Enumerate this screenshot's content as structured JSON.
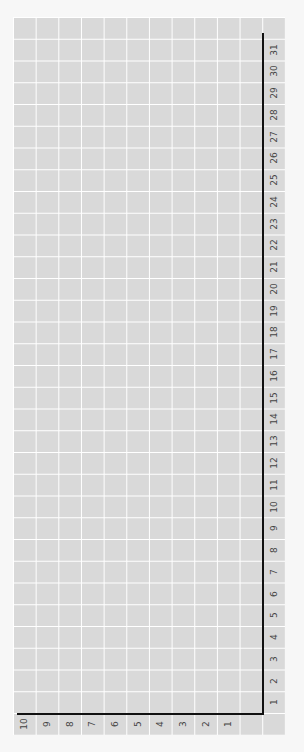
{
  "chart_data": {
    "type": "table",
    "title": "",
    "orientation": "rotated -90deg",
    "x_ticks": [
      "1",
      "2",
      "3",
      "4",
      "5",
      "6",
      "7",
      "8",
      "9",
      "10",
      "11",
      "12",
      "13",
      "14",
      "15",
      "16",
      "17",
      "18",
      "19",
      "20",
      "21",
      "22",
      "23",
      "24",
      "25",
      "26",
      "27",
      "28",
      "29",
      "30",
      "31"
    ],
    "y_ticks": [
      "1",
      "2",
      "3",
      "4",
      "5",
      "6",
      "7",
      "8",
      "9",
      "10"
    ],
    "grid": true,
    "series": [],
    "colors": {
      "grid_fill": "#d9d9d9",
      "grid_lines": "#ffffff",
      "axis": "#111111"
    }
  }
}
